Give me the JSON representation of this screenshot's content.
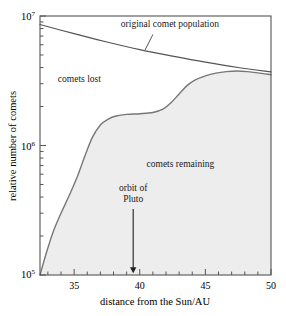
{
  "chart_data": {
    "type": "area",
    "title": "",
    "subtitle": "",
    "xlabel": "distance from the Sun/AU",
    "ylabel": "relative number of comets",
    "xlim": [
      32.4,
      50
    ],
    "ylim": [
      100000,
      10000000
    ],
    "yscale": "log",
    "xscale": "linear",
    "grid": false,
    "legend_position": "none",
    "x_ticks_major": [
      35,
      40,
      45,
      50
    ],
    "x_tick_labels": [
      "35",
      "40",
      "45",
      "50"
    ],
    "x_ticks_minor_step": 1,
    "y_ticks_major": [
      100000,
      1000000,
      10000000
    ],
    "y_tick_labels": [
      "10⁵",
      "10⁶",
      "10⁷"
    ],
    "y_tick_label_parts": [
      {
        "base": "10",
        "exp": "5"
      },
      {
        "base": "10",
        "exp": "6"
      },
      {
        "base": "10",
        "exp": "7"
      }
    ],
    "series": [
      {
        "name": "original comet population",
        "kind": "line",
        "color": "#555555",
        "x": [
          32.4,
          35.0,
          37.5,
          40.0,
          42.5,
          45.0,
          47.5,
          50.0
        ],
        "y": [
          8600000,
          7300000,
          6300000,
          5500000,
          4900000,
          4400000,
          4000000,
          3700000
        ]
      },
      {
        "name": "comets remaining",
        "kind": "area",
        "color": "#777777",
        "fill": "#ededed",
        "x": [
          32.4,
          32.9,
          33.4,
          34.0,
          34.6,
          35.2,
          35.8,
          36.4,
          37.0,
          37.6,
          38.2,
          39.0,
          40.0,
          41.0,
          41.8,
          42.4,
          43.0,
          43.6,
          44.2,
          45.0,
          45.8,
          46.6,
          47.4,
          48.2,
          49.0,
          50.0
        ],
        "y": [
          100000,
          150000,
          215000,
          300000,
          405000,
          560000,
          820000,
          1160000,
          1440000,
          1600000,
          1690000,
          1740000,
          1760000,
          1800000,
          1920000,
          2150000,
          2500000,
          2900000,
          3200000,
          3450000,
          3620000,
          3720000,
          3760000,
          3720000,
          3640000,
          3520000
        ]
      }
    ],
    "regions": [
      {
        "name": "comets lost",
        "label": "comets lost",
        "x": 35.4,
        "y": 3100000
      },
      {
        "name": "comets remaining",
        "label": "comets remaining",
        "x": 43.1,
        "y": 680000
      }
    ],
    "annotations": [
      {
        "name": "original-comet-population",
        "text": "original comet population",
        "text_x": 42.3,
        "text_y": 8200000,
        "leader_from_x": 41.0,
        "leader_from_y": 7200000,
        "leader_to_x": 40.4,
        "leader_to_y": 5450000
      },
      {
        "name": "orbit-of-pluto",
        "text_line1": "orbit of",
        "text_line2": "Pluto",
        "x": 39.5,
        "arrow_top_y": 280000,
        "arrow_tip_y": 103000
      }
    ]
  },
  "figure": {
    "background": "#ffffff",
    "frame_color": "#555555",
    "fill_color": "#ededed",
    "curve_color": "#777777",
    "line_color": "#555555",
    "text_color": "#000000"
  }
}
